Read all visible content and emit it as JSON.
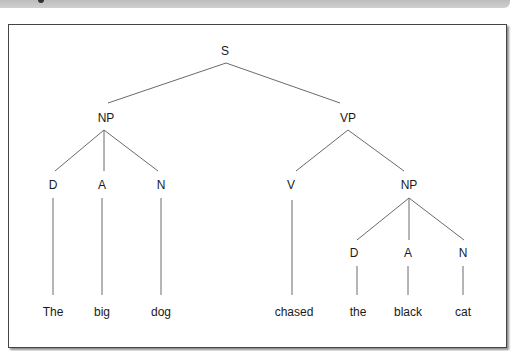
{
  "figure": {
    "header_bar_color": "#c6c6c6",
    "frame_border_color": "#444444",
    "line_color": "#6a6a6a"
  },
  "tree": {
    "nodes": [
      {
        "id": "S",
        "label": "S",
        "x": 225,
        "y": 55
      },
      {
        "id": "NP1",
        "label": "NP",
        "x": 106,
        "y": 122
      },
      {
        "id": "VP",
        "label": "VP",
        "x": 348,
        "y": 122
      },
      {
        "id": "D1",
        "label": "D",
        "x": 53,
        "y": 189
      },
      {
        "id": "A1",
        "label": "A",
        "x": 102,
        "y": 189
      },
      {
        "id": "N1",
        "label": "N",
        "x": 161,
        "y": 189
      },
      {
        "id": "V",
        "label": "V",
        "x": 291,
        "y": 189
      },
      {
        "id": "NP2",
        "label": "NP",
        "x": 409,
        "y": 189
      },
      {
        "id": "D2",
        "label": "D",
        "x": 354,
        "y": 257
      },
      {
        "id": "A2",
        "label": "A",
        "x": 408,
        "y": 257
      },
      {
        "id": "N2",
        "label": "N",
        "x": 463,
        "y": 257
      },
      {
        "id": "w_the1",
        "label": "The",
        "x": 53,
        "y": 316
      },
      {
        "id": "w_big",
        "label": "big",
        "x": 102,
        "y": 316
      },
      {
        "id": "w_dog",
        "label": "dog",
        "x": 161,
        "y": 316
      },
      {
        "id": "w_chased",
        "label": "chased",
        "x": 294,
        "y": 316
      },
      {
        "id": "w_the2",
        "label": "the",
        "x": 358,
        "y": 316
      },
      {
        "id": "w_black",
        "label": "black",
        "x": 408,
        "y": 316
      },
      {
        "id": "w_cat",
        "label": "cat",
        "x": 463,
        "y": 316
      }
    ],
    "edges": [
      {
        "from": "S",
        "to": "NP1",
        "x1": 226,
        "y1": 63,
        "x2": 108,
        "y2": 103
      },
      {
        "from": "S",
        "to": "VP",
        "x1": 226,
        "y1": 63,
        "x2": 340,
        "y2": 103
      },
      {
        "from": "NP1",
        "to": "D1",
        "x1": 104,
        "y1": 130,
        "x2": 55,
        "y2": 171
      },
      {
        "from": "NP1",
        "to": "A1",
        "x1": 104,
        "y1": 130,
        "x2": 104,
        "y2": 171
      },
      {
        "from": "NP1",
        "to": "N1",
        "x1": 104,
        "y1": 130,
        "x2": 158,
        "y2": 171
      },
      {
        "from": "VP",
        "to": "V",
        "x1": 348,
        "y1": 130,
        "x2": 296,
        "y2": 171
      },
      {
        "from": "VP",
        "to": "NP2",
        "x1": 348,
        "y1": 130,
        "x2": 404,
        "y2": 171
      },
      {
        "from": "D1",
        "to": "w_the1",
        "x1": 53,
        "y1": 198,
        "x2": 53,
        "y2": 295
      },
      {
        "from": "A1",
        "to": "w_big",
        "x1": 102,
        "y1": 198,
        "x2": 102,
        "y2": 295
      },
      {
        "from": "N1",
        "to": "w_dog",
        "x1": 161,
        "y1": 198,
        "x2": 161,
        "y2": 295
      },
      {
        "from": "V",
        "to": "w_chased",
        "x1": 292,
        "y1": 200,
        "x2": 292,
        "y2": 295
      },
      {
        "from": "NP2",
        "to": "D2",
        "x1": 409,
        "y1": 198,
        "x2": 357,
        "y2": 240
      },
      {
        "from": "NP2",
        "to": "A2",
        "x1": 409,
        "y1": 198,
        "x2": 409,
        "y2": 240
      },
      {
        "from": "NP2",
        "to": "N2",
        "x1": 409,
        "y1": 198,
        "x2": 464,
        "y2": 240
      },
      {
        "from": "D2",
        "to": "w_the2",
        "x1": 357,
        "y1": 266,
        "x2": 357,
        "y2": 295
      },
      {
        "from": "A2",
        "to": "w_black",
        "x1": 408,
        "y1": 266,
        "x2": 408,
        "y2": 295
      },
      {
        "from": "N2",
        "to": "w_cat",
        "x1": 463,
        "y1": 266,
        "x2": 463,
        "y2": 295
      }
    ]
  }
}
